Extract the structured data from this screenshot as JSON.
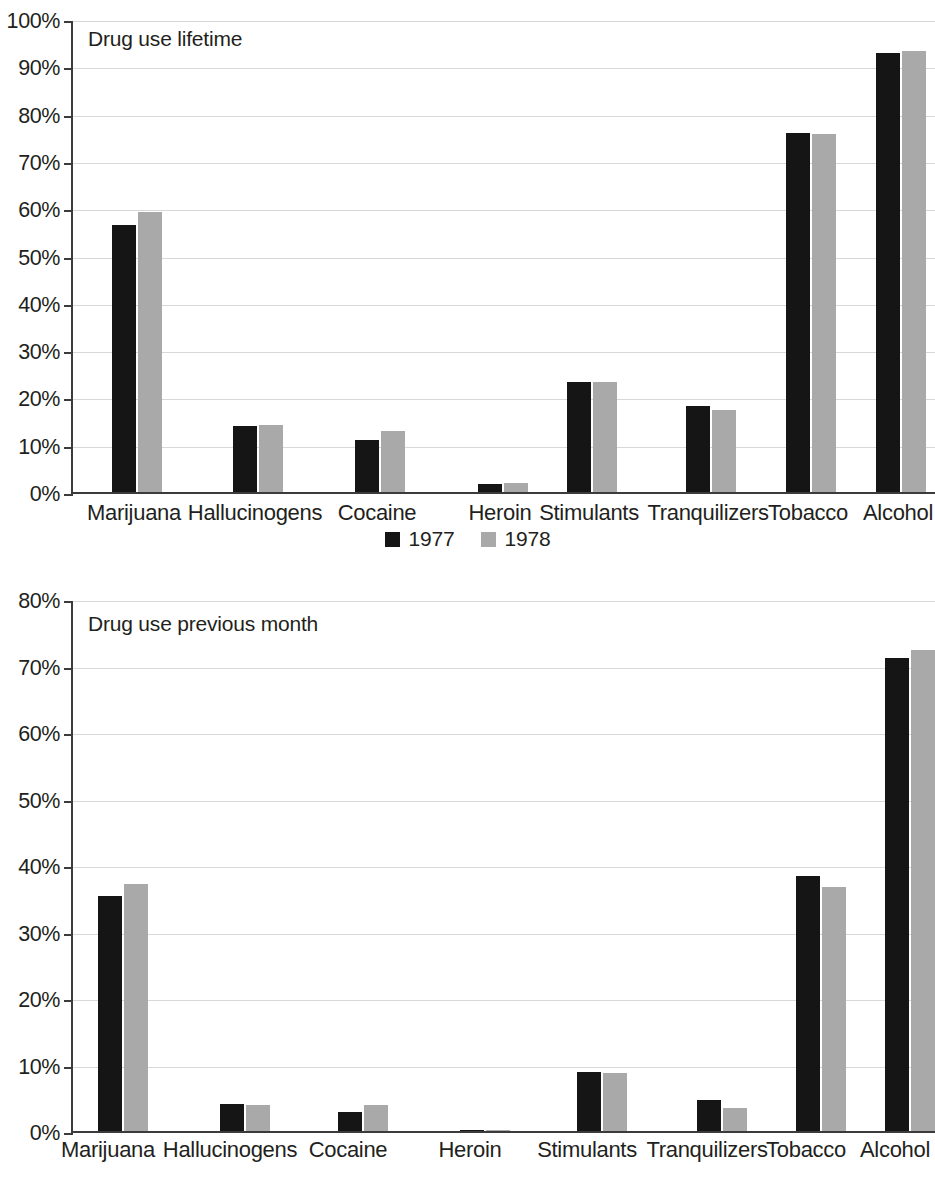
{
  "legend": {
    "items": [
      {
        "label": "1977",
        "color": "#151515"
      },
      {
        "label": "1978",
        "color": "#a9a9a9"
      }
    ]
  },
  "charts": [
    {
      "title": "Drug use lifetime",
      "ytick_labels": [
        "0%",
        "10%",
        "20%",
        "30%",
        "40%",
        "50%",
        "60%",
        "70%",
        "80%",
        "90%",
        "100%"
      ],
      "categories": [
        "Marijuana",
        "Hallucinogens",
        "Cocaine",
        "Heroin",
        "Stimulants",
        "Tranquilizers",
        "Tobacco",
        "Alcohol"
      ]
    },
    {
      "title": "Drug use previous month",
      "ytick_labels": [
        "0%",
        "10%",
        "20%",
        "30%",
        "40%",
        "50%",
        "60%",
        "70%",
        "80%"
      ],
      "categories": [
        "Marijuana",
        "Hallucinogens",
        "Cocaine",
        "Heroin",
        "Stimulants",
        "Tranquilizers",
        "Tobacco",
        "Alcohol"
      ]
    }
  ],
  "chart_data": [
    {
      "type": "bar",
      "title": "Drug use lifetime",
      "xlabel": "",
      "ylabel": "",
      "ylim": [
        0,
        100
      ],
      "ytick_values": [
        0,
        10,
        20,
        30,
        40,
        50,
        60,
        70,
        80,
        90,
        100
      ],
      "grid": true,
      "legend_position": "bottom-center",
      "categories": [
        "Marijuana",
        "Hallucinogens",
        "Cocaine",
        "Heroin",
        "Stimulants",
        "Tranquilizers",
        "Tobacco",
        "Alcohol"
      ],
      "series": [
        {
          "name": "1977",
          "color": "#151515",
          "values": [
            56.4,
            14.0,
            11.1,
            1.8,
            23.2,
            18.2,
            75.9,
            92.8
          ]
        },
        {
          "name": "1978",
          "color": "#a9a9a9",
          "values": [
            59.2,
            14.2,
            12.9,
            1.9,
            23.2,
            17.4,
            75.6,
            93.3
          ]
        }
      ]
    },
    {
      "type": "bar",
      "title": "Drug use previous month",
      "xlabel": "",
      "ylabel": "",
      "ylim": [
        0,
        80
      ],
      "ytick_values": [
        0,
        10,
        20,
        30,
        40,
        50,
        60,
        70,
        80
      ],
      "grid": true,
      "legend_position": "bottom-center",
      "categories": [
        "Marijuana",
        "Hallucinogens",
        "Cocaine",
        "Heroin",
        "Stimulants",
        "Tranquilizers",
        "Tobacco",
        "Alcohol"
      ],
      "series": [
        {
          "name": "1977",
          "color": "#151515",
          "values": [
            35.4,
            4.1,
            2.9,
            0.2,
            8.8,
            4.6,
            38.4,
            71.2
          ]
        },
        {
          "name": "1978",
          "color": "#a9a9a9",
          "values": [
            37.1,
            3.9,
            3.9,
            0.1,
            8.7,
            3.4,
            36.7,
            72.3
          ]
        }
      ]
    }
  ]
}
